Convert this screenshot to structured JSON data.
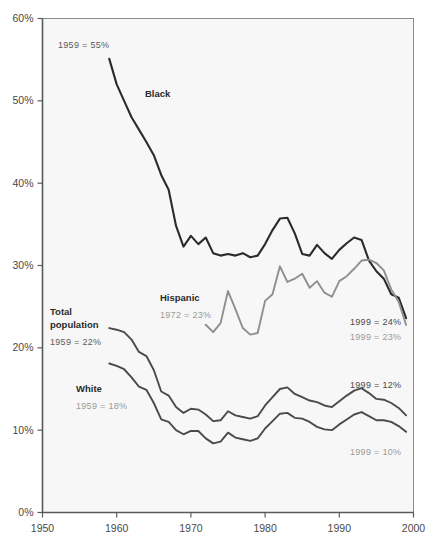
{
  "chart_data": {
    "type": "line",
    "title": "",
    "subtitle": "",
    "xlabel": "",
    "ylabel": "",
    "xlim": [
      1950,
      2000
    ],
    "ylim": [
      0,
      60
    ],
    "grid": false,
    "legend_position": "inline-annotations",
    "x_ticks": [
      "1950",
      "1960",
      "1970",
      "1980",
      "1990",
      "2000"
    ],
    "x_tick_values": [
      1950,
      1960,
      1970,
      1980,
      1990,
      2000
    ],
    "y_ticks": [
      "0%",
      "10%",
      "20%",
      "30%",
      "40%",
      "50%",
      "60%"
    ],
    "y_tick_values": [
      0,
      10,
      20,
      30,
      40,
      50,
      60
    ],
    "series": [
      {
        "name": "Black",
        "color": "#2b2b2b",
        "width": 2.1,
        "start_label": "1959 = 55%",
        "end_label": "1999 = 24%",
        "x": [
          1959,
          1960,
          1961,
          1962,
          1963,
          1964,
          1965,
          1966,
          1967,
          1968,
          1969,
          1970,
          1971,
          1972,
          1973,
          1974,
          1975,
          1976,
          1977,
          1978,
          1979,
          1980,
          1981,
          1982,
          1983,
          1984,
          1985,
          1986,
          1987,
          1988,
          1989,
          1990,
          1991,
          1992,
          1993,
          1994,
          1995,
          1996,
          1997,
          1998,
          1999
        ],
        "values": [
          55.1,
          52.0,
          50.0,
          48.0,
          46.5,
          45.0,
          43.4,
          41.0,
          39.2,
          34.8,
          32.3,
          33.6,
          32.6,
          33.4,
          31.5,
          31.2,
          31.4,
          31.2,
          31.5,
          31.0,
          31.2,
          32.6,
          34.3,
          35.7,
          35.8,
          33.9,
          31.4,
          31.2,
          32.5,
          31.5,
          30.8,
          31.9,
          32.7,
          33.4,
          33.1,
          30.6,
          29.3,
          28.4,
          26.5,
          26.1,
          23.6
        ]
      },
      {
        "name": "Hispanic",
        "color": "#8f8f8f",
        "width": 1.9,
        "start_label": "1972 = 23%",
        "end_label": "1999 = 23%",
        "x": [
          1972,
          1973,
          1974,
          1975,
          1976,
          1977,
          1978,
          1979,
          1980,
          1981,
          1982,
          1983,
          1984,
          1985,
          1986,
          1987,
          1988,
          1989,
          1990,
          1991,
          1992,
          1993,
          1994,
          1995,
          1996,
          1997,
          1998,
          1999
        ],
        "values": [
          22.8,
          21.9,
          23.0,
          26.9,
          24.7,
          22.4,
          21.6,
          21.8,
          25.7,
          26.5,
          29.9,
          28.0,
          28.4,
          29.0,
          27.3,
          28.1,
          26.7,
          26.2,
          28.1,
          28.7,
          29.6,
          30.6,
          30.7,
          30.3,
          29.4,
          27.1,
          25.6,
          22.8
        ]
      },
      {
        "name": "Total population",
        "color": "#4a4a4a",
        "width": 1.9,
        "start_label": "1959 = 22%",
        "end_label": "1999 = 12%",
        "x": [
          1959,
          1960,
          1961,
          1962,
          1963,
          1964,
          1965,
          1966,
          1967,
          1968,
          1969,
          1970,
          1971,
          1972,
          1973,
          1974,
          1975,
          1976,
          1977,
          1978,
          1979,
          1980,
          1981,
          1982,
          1983,
          1984,
          1985,
          1986,
          1987,
          1988,
          1989,
          1990,
          1991,
          1992,
          1993,
          1994,
          1995,
          1996,
          1997,
          1998,
          1999
        ],
        "values": [
          22.4,
          22.2,
          21.9,
          21.0,
          19.5,
          19.0,
          17.3,
          14.7,
          14.2,
          12.8,
          12.1,
          12.6,
          12.5,
          11.9,
          11.1,
          11.2,
          12.3,
          11.8,
          11.6,
          11.4,
          11.7,
          13.0,
          14.0,
          15.0,
          15.2,
          14.4,
          14.0,
          13.6,
          13.4,
          13.0,
          12.8,
          13.5,
          14.2,
          14.8,
          15.1,
          14.5,
          13.8,
          13.7,
          13.3,
          12.7,
          11.8
        ]
      },
      {
        "name": "White",
        "color": "#4a4a4a",
        "width": 1.9,
        "start_label": "1959 = 18%",
        "end_label": "1999 = 10%",
        "x": [
          1959,
          1960,
          1961,
          1962,
          1963,
          1964,
          1965,
          1966,
          1967,
          1968,
          1969,
          1970,
          1971,
          1972,
          1973,
          1974,
          1975,
          1976,
          1977,
          1978,
          1979,
          1980,
          1981,
          1982,
          1983,
          1984,
          1985,
          1986,
          1987,
          1988,
          1989,
          1990,
          1991,
          1992,
          1993,
          1994,
          1995,
          1996,
          1997,
          1998,
          1999
        ],
        "values": [
          18.1,
          17.8,
          17.4,
          16.4,
          15.3,
          14.9,
          13.3,
          11.3,
          11.0,
          10.0,
          9.5,
          9.9,
          9.9,
          9.0,
          8.4,
          8.6,
          9.7,
          9.1,
          8.9,
          8.7,
          9.0,
          10.2,
          11.1,
          12.0,
          12.1,
          11.5,
          11.4,
          11.0,
          10.4,
          10.1,
          10.0,
          10.7,
          11.3,
          11.9,
          12.2,
          11.7,
          11.2,
          11.2,
          11.0,
          10.5,
          9.8
        ]
      }
    ],
    "annotations": [
      {
        "text": "1959 = 55%",
        "series": "Black",
        "position": "upper-left",
        "style": "dark"
      },
      {
        "text": "Black",
        "series": "Black",
        "position": "inline",
        "style": "bold"
      },
      {
        "text": "Hispanic",
        "series": "Hispanic",
        "position": "inline",
        "style": "bold"
      },
      {
        "text": "1972 = 23%",
        "series": "Hispanic",
        "position": "inline",
        "style": "light"
      },
      {
        "text": "Total population",
        "series": "Total population",
        "position": "left",
        "style": "bold"
      },
      {
        "text": "1959 = 22%",
        "series": "Total population",
        "position": "left",
        "style": "dark"
      },
      {
        "text": "White",
        "series": "White",
        "position": "left",
        "style": "bold"
      },
      {
        "text": "1959 = 18%",
        "series": "White",
        "position": "left",
        "style": "light"
      },
      {
        "text": "1999 = 24%",
        "series": "Black",
        "position": "right",
        "style": "dark"
      },
      {
        "text": "1999 = 23%",
        "series": "Hispanic",
        "position": "right",
        "style": "light"
      },
      {
        "text": "1999 = 12%",
        "series": "Total population",
        "position": "right",
        "style": "dark"
      },
      {
        "text": "1999 = 10%",
        "series": "White",
        "position": "right",
        "style": "light"
      }
    ],
    "colors": {
      "plot_background": "#f7f7f7",
      "plot_border": "#7d7d7d",
      "axis_line": "#5a5a5a",
      "tick_label": "#4a4a4a",
      "series_black": "#2b2b2b",
      "series_hispanic": "#8f8f8f",
      "series_total": "#4a4a4a",
      "series_white": "#4a4a4a",
      "page_background": "#ffffff"
    }
  },
  "labels": {
    "black_series": "Black",
    "hispanic_series": "Hispanic",
    "total_population_line1": "Total",
    "total_population_line2": "population",
    "white_series": "White",
    "black_start": "1959 = 55%",
    "hispanic_start": "1972 = 23%",
    "total_start": "1959 = 22%",
    "white_start": "1959 = 18%",
    "black_end": "1999 = 24%",
    "hispanic_end": "1999 = 23%",
    "total_end": "1999 = 12%",
    "white_end": "1999 = 10%"
  },
  "axes": {
    "y": [
      "60%",
      "50%",
      "40%",
      "30%",
      "20%",
      "10%",
      "0%"
    ],
    "x": [
      "1950",
      "1960",
      "1970",
      "1980",
      "1990",
      "2000"
    ]
  }
}
